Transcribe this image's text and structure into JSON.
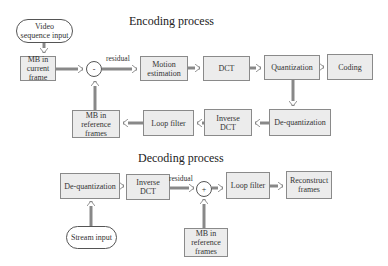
{
  "encoding": {
    "title": "Encoding process",
    "nodes": {
      "video_input": "Video\nsequence input",
      "mb_current": "MB in\ncurrent\nframe",
      "subtract": "-",
      "motion_estimation": "Motion\nestimation",
      "dct": "DCT",
      "quantization": "Quantization",
      "coding": "Coding",
      "dequantization": "De-quantization",
      "inverse_dct": "Inverse\nDCT",
      "loop_filter": "Loop filter",
      "mb_reference": "MB in\nreference\nframes"
    },
    "edge_labels": {
      "residual": "residual"
    }
  },
  "decoding": {
    "title": "Decoding process",
    "nodes": {
      "dequantization": "De-quantization",
      "inverse_dct": "Inverse\nDCT",
      "add": "+",
      "loop_filter": "Loop filter",
      "reconstruct": "Reconstruct\nframes",
      "mb_reference": "MB in\nreference\nframes",
      "stream_input": "Stream input"
    },
    "edge_labels": {
      "residual": "residual"
    }
  },
  "colors": {
    "box_fill": "#ececec",
    "box_border": "#8a8a8a",
    "arrow": "#888888"
  }
}
